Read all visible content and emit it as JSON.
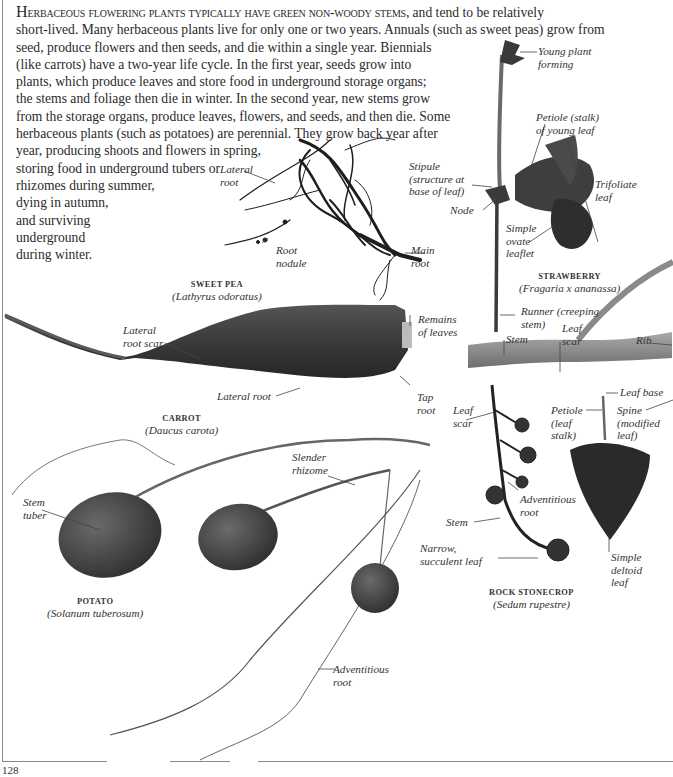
{
  "intro": {
    "lead_cap": "H",
    "lead_smallcaps": "erbaceous flowering plants typically have green non-woody stems,",
    "lines": [
      " and tend to be relatively",
      "short-lived. Many herbaceous plants live for only one or two years. Annuals (such as sweet peas) grow from",
      "seed, produce flowers and then seeds, and die within a single year. Biennials",
      "(like carrots) have a two-year life cycle. In the first year, seeds grow into",
      "plants, which produce leaves and store food in underground storage organs;",
      "the stems and foliage then die in winter. In the second year, new stems grow",
      "from the storage organs, produce leaves, flowers, and seeds, and then die. Some",
      "herbaceous plants (such as potatoes) are perennial. They grow back year after",
      "year, producing shoots and flowers in spring,",
      "storing food in underground tubers or",
      "rhizomes during summer,",
      "dying in autumn,",
      "and surviving",
      "underground",
      "during winter."
    ]
  },
  "specimens": {
    "sweet_pea": {
      "common": "SWEET PEA",
      "latin": "(Lathyrus odoratus)",
      "labels": {
        "lateral_root": [
          "Lateral",
          "root"
        ],
        "root_nodule": [
          "Root",
          "nodule"
        ],
        "main_root": [
          "Main",
          "root"
        ]
      }
    },
    "strawberry": {
      "common": "STRAWBERRY",
      "latin": "(Fragaria x ananassa)",
      "labels": {
        "young_plant": [
          "Young plant",
          "forming"
        ],
        "petiole": [
          "Petiole (stalk)",
          "of young leaf"
        ],
        "stipule": [
          "Stipule",
          "(structure at",
          "base of leaf)"
        ],
        "trifoliate": [
          "Trifoliate",
          "leaf"
        ],
        "node": [
          "Node"
        ],
        "simple_ovate": [
          "Simple",
          "ovate",
          "leaflet"
        ],
        "runner": [
          "Runner (creeping",
          "stem)"
        ]
      }
    },
    "carrot": {
      "common": "CARROT",
      "latin": "(Daucus carota)",
      "labels": {
        "lateral_root_scar": [
          "Lateral",
          "root scar"
        ],
        "remains_of_leaves": [
          "Remains",
          "of leaves"
        ],
        "lateral_root": [
          "Lateral root"
        ],
        "tap_root": [
          "Tap",
          "root"
        ]
      }
    },
    "woody_stem": {
      "labels": {
        "stem": [
          "Stem"
        ],
        "leaf_scar": [
          "Leaf",
          "scar"
        ],
        "rib": [
          "Rib"
        ]
      }
    },
    "deltoid_leaf": {
      "labels": {
        "leaf_base": [
          "Leaf base"
        ],
        "petiole": [
          "Petiole",
          "(leaf",
          "stalk)"
        ],
        "spine": [
          "Spine",
          "(modified",
          "leaf)"
        ],
        "simple_deltoid": [
          "Simple",
          "deltoid",
          "leaf"
        ]
      }
    },
    "rock_stonecrop": {
      "common": "ROCK STONECROP",
      "latin": "(Sedum rupestre)",
      "labels": {
        "leaf_scar": [
          "Leaf",
          "scar"
        ],
        "adventitious_root": [
          "Adventitious",
          "root"
        ],
        "stem": [
          "Stem"
        ],
        "narrow_leaf": [
          "Narrow,",
          "succulent leaf"
        ]
      }
    },
    "potato": {
      "common": "POTATO",
      "latin": "(Solanum tuberosum)",
      "labels": {
        "stem_tuber": [
          "Stem",
          "tuber"
        ],
        "slender_rhizome": [
          "Slender",
          "rhizome"
        ],
        "adventitious_root": [
          "Adventitious",
          "root"
        ]
      }
    }
  },
  "page_number": "128"
}
